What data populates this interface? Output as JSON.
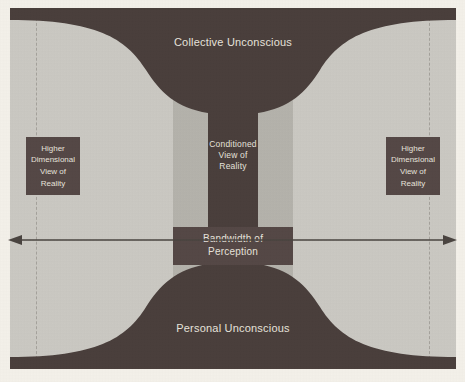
{
  "diagram": {
    "background_color": "#f4f1ea",
    "panel_color": "#d8d5cf",
    "dark_color": "#4a3f3c",
    "box_color": "#554846",
    "text_color": "#e8e4dd",
    "arrow_color": "#4a4440",
    "labels": {
      "collective_unconscious": "Collective Unconscious",
      "personal_unconscious": "Personal Unconscious",
      "conditioned_view": "Conditioned View of Reality",
      "conditioned_view_line1": "Conditioned",
      "conditioned_view_line2": "View of",
      "conditioned_view_line3": "Reality",
      "bandwidth_line1": "Bandwidth of",
      "bandwidth_line2": "Perception",
      "higher_left": "Higher Dimensional View of Reality",
      "higher_left_line1": "Higher",
      "higher_left_line2": "Dimensional",
      "higher_left_line3": "View of",
      "higher_left_line4": "Reality",
      "higher_right": "Higher Dimensional View of Reality",
      "higher_right_line1": "Higher",
      "higher_right_line2": "Dimensional",
      "higher_right_line3": "View of",
      "higher_right_line4": "Reality"
    },
    "bands": [
      {
        "name": "outer-left",
        "color": "#cbc9c3"
      },
      {
        "name": "mid-left",
        "color": "#b5b3ac"
      },
      {
        "name": "core",
        "color": "#4a3f3c"
      },
      {
        "name": "mid-right",
        "color": "#b5b3ac"
      },
      {
        "name": "outer-right",
        "color": "#cbc9c3"
      }
    ],
    "arrow": {
      "name": "double-headed-horizontal-arrow",
      "direction": "both",
      "y": 240
    },
    "guides": [
      {
        "name": "dashed-guide-left",
        "style": "dashed"
      },
      {
        "name": "dashed-guide-right",
        "style": "dashed"
      }
    ]
  }
}
